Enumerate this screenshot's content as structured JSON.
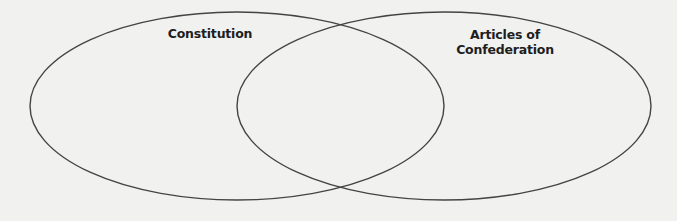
{
  "venn": {
    "left_set": {
      "label": "Constitution",
      "cx": 237,
      "cy": 106,
      "rx": 207,
      "ry": 94
    },
    "right_set": {
      "label_line1": "Articles of",
      "label_line2": "Confederation",
      "cx": 444,
      "cy": 106,
      "rx": 207,
      "ry": 94
    },
    "stroke_color": "#444444",
    "background_color": "#f1f1ef"
  }
}
